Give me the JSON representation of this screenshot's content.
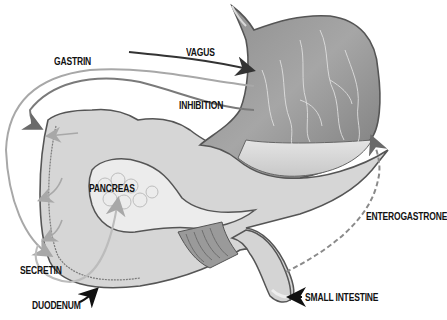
{
  "diagram": {
    "type": "anatomical illustration",
    "colors": {
      "background": "#ffffff",
      "organ_fill": "#d9d9d9",
      "organ_dark": "#8a8a8a",
      "organ_outline": "#555555",
      "stomach_interior": "#9a9a9a",
      "arrow_dark": "#333333",
      "arrow_light": "#a8a8a8",
      "label_text": "#111111"
    },
    "labels": {
      "gastrin": "GASTRIN",
      "vagus": "VAGUS",
      "inhibition": "INHIBITION",
      "pancreas": "PANCREAS",
      "enterogastrone": "ENTEROGASTRONE",
      "secretin": "SECRETIN",
      "duodenum": "DUODENUM",
      "small_intestine": "SMALL INTESTINE"
    },
    "pathways": [
      {
        "name": "vagus",
        "style": "solid dark arrow",
        "target": "stomach"
      },
      {
        "name": "gastrin",
        "style": "solid light arrow",
        "target": "stomach"
      },
      {
        "name": "inhibition",
        "style": "solid medium arrow",
        "target": "stomach"
      },
      {
        "name": "secretin",
        "style": "solid light arrow",
        "target": "pancreas"
      },
      {
        "name": "enterogastrone",
        "style": "dashed arrow",
        "source": "small intestine",
        "target": "stomach"
      }
    ]
  }
}
